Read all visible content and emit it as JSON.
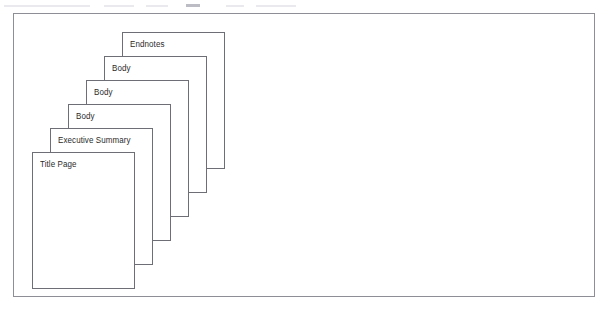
{
  "diagram": {
    "type": "stacked-pages-cascade",
    "frame": {
      "border_color": "#8e8e96",
      "background_color": "#ffffff"
    },
    "sheet_style": {
      "fill_color": "#ffffff",
      "border_color": "#6e6e76",
      "label_color": "#2b2b2b",
      "width_px": 103,
      "height_px": 137
    },
    "stack_order": "front-to-back",
    "step_offset": {
      "x_px": 18,
      "y_px": -24
    },
    "pages": [
      {
        "label": "Title Page",
        "x": 18,
        "y": 138,
        "z": 6
      },
      {
        "label": "Executive Summary",
        "x": 36,
        "y": 114,
        "z": 5
      },
      {
        "label": "Body",
        "x": 54,
        "y": 90,
        "z": 4
      },
      {
        "label": "Body",
        "x": 72,
        "y": 66,
        "z": 3
      },
      {
        "label": "Body",
        "x": 90,
        "y": 42,
        "z": 2
      },
      {
        "label": "Endnotes",
        "x": 108,
        "y": 18,
        "z": 1
      }
    ]
  },
  "scan_artifact": {
    "top_sliver_label": "clipped-text-row-above-frame"
  }
}
